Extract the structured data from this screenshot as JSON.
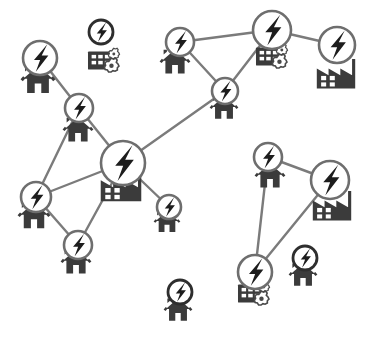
{
  "diagram": {
    "canvas": {
      "width": 367,
      "height": 349,
      "background": "#ffffff"
    },
    "colors": {
      "edge": "#7b7b7b",
      "node_stroke": "#6e6e6e",
      "node_fill": "#ffffff",
      "bolt": "#1d1d1d",
      "building": "#3b3b3b",
      "gear_stroke": "#4a4a4a"
    },
    "legend": {
      "node_symbol": "lightning-bolt",
      "load_types": [
        "house",
        "factory",
        "industrial-plant-with-gears"
      ]
    }
  },
  "chart_data": {
    "type": "diagram",
    "nodes": [
      {
        "id": "n1",
        "label": "bolt-node-1",
        "x": 40,
        "y": 58,
        "r": 17,
        "style": "linked"
      },
      {
        "id": "n2",
        "label": "bolt-node-2",
        "x": 101,
        "y": 32,
        "r": 12,
        "style": "isolated"
      },
      {
        "id": "n3",
        "label": "bolt-node-3",
        "x": 79,
        "y": 108,
        "r": 14,
        "style": "linked"
      },
      {
        "id": "n4",
        "label": "bolt-node-4",
        "x": 180,
        "y": 42,
        "r": 14,
        "style": "linked"
      },
      {
        "id": "n5",
        "label": "bolt-node-5",
        "x": 272,
        "y": 30,
        "r": 19,
        "style": "linked"
      },
      {
        "id": "n6",
        "label": "bolt-node-6",
        "x": 337,
        "y": 45,
        "r": 18,
        "style": "linked"
      },
      {
        "id": "n7",
        "label": "bolt-node-7",
        "x": 225,
        "y": 91,
        "r": 13,
        "style": "linked"
      },
      {
        "id": "n8",
        "label": "bolt-node-8",
        "x": 123,
        "y": 163,
        "r": 22,
        "style": "linked"
      },
      {
        "id": "n9",
        "label": "bolt-node-9",
        "x": 36,
        "y": 197,
        "r": 15,
        "style": "linked"
      },
      {
        "id": "n10",
        "label": "bolt-node-10",
        "x": 78,
        "y": 245,
        "r": 14,
        "style": "linked"
      },
      {
        "id": "n11",
        "label": "bolt-node-11",
        "x": 169,
        "y": 207,
        "r": 12,
        "style": "linked"
      },
      {
        "id": "n12",
        "label": "bolt-node-12",
        "x": 268,
        "y": 157,
        "r": 14,
        "style": "linked"
      },
      {
        "id": "n13",
        "label": "bolt-node-13",
        "x": 330,
        "y": 180,
        "r": 19,
        "style": "linked"
      },
      {
        "id": "n14",
        "label": "bolt-node-14",
        "x": 255,
        "y": 272,
        "r": 17,
        "style": "linked"
      },
      {
        "id": "n15",
        "label": "bolt-node-15",
        "x": 305,
        "y": 258,
        "r": 12,
        "style": "isolated"
      },
      {
        "id": "n16",
        "label": "bolt-node-16",
        "x": 180,
        "y": 292,
        "r": 12,
        "style": "isolated"
      }
    ],
    "edges": [
      {
        "from": "n1",
        "to": "n3"
      },
      {
        "from": "n3",
        "to": "n8"
      },
      {
        "from": "n3",
        "to": "n9"
      },
      {
        "from": "n4",
        "to": "n5"
      },
      {
        "from": "n4",
        "to": "n7"
      },
      {
        "from": "n5",
        "to": "n6"
      },
      {
        "from": "n5",
        "to": "n7"
      },
      {
        "from": "n7",
        "to": "n8"
      },
      {
        "from": "n8",
        "to": "n9"
      },
      {
        "from": "n8",
        "to": "n10"
      },
      {
        "from": "n8",
        "to": "n11"
      },
      {
        "from": "n9",
        "to": "n10"
      },
      {
        "from": "n12",
        "to": "n13"
      },
      {
        "from": "n12",
        "to": "n14"
      },
      {
        "from": "n13",
        "to": "n14"
      }
    ],
    "loads": [
      {
        "type": "house",
        "x": 38,
        "y": 80,
        "size": 34,
        "attached_to": "n1"
      },
      {
        "type": "plant",
        "x": 104,
        "y": 60,
        "size": 32,
        "attached_to": "n2"
      },
      {
        "type": "house",
        "x": 78,
        "y": 130,
        "size": 30,
        "attached_to": "n3"
      },
      {
        "type": "house",
        "x": 175,
        "y": 62,
        "size": 30,
        "attached_to": "n4"
      },
      {
        "type": "plant",
        "x": 272,
        "y": 56,
        "size": 32,
        "attached_to": "n5"
      },
      {
        "type": "factory",
        "x": 336,
        "y": 74,
        "size": 36,
        "attached_to": "n6"
      },
      {
        "type": "house",
        "x": 224,
        "y": 108,
        "size": 28,
        "attached_to": "n7"
      },
      {
        "type": "factory",
        "x": 121,
        "y": 186,
        "size": 38,
        "attached_to": "n8"
      },
      {
        "type": "house",
        "x": 34,
        "y": 216,
        "size": 32,
        "attached_to": "n9"
      },
      {
        "type": "house",
        "x": 76,
        "y": 262,
        "size": 30,
        "attached_to": "n10"
      },
      {
        "type": "house",
        "x": 167,
        "y": 222,
        "size": 26,
        "attached_to": "n11"
      },
      {
        "type": "house",
        "x": 270,
        "y": 176,
        "size": 30,
        "attached_to": "n12"
      },
      {
        "type": "factory",
        "x": 332,
        "y": 206,
        "size": 36,
        "attached_to": "n13"
      },
      {
        "type": "plant",
        "x": 254,
        "y": 293,
        "size": 32,
        "attached_to": "n14"
      },
      {
        "type": "house",
        "x": 303,
        "y": 275,
        "size": 28,
        "attached_to": "n15"
      },
      {
        "type": "house",
        "x": 178,
        "y": 310,
        "size": 28,
        "attached_to": "n16"
      }
    ]
  }
}
